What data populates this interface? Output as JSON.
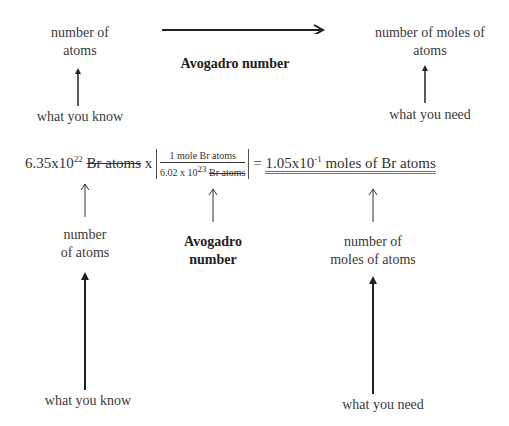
{
  "top": {
    "left_label": [
      "number of",
      "atoms"
    ],
    "center_label": "Avogadro number",
    "right_label": [
      "number of moles of",
      "atoms"
    ],
    "left_caption": "what you know",
    "right_caption": "what you need"
  },
  "equation": {
    "given_mantissa": "6.35x10",
    "given_exponent": "22",
    "given_unit": "Br atoms",
    "times": "x",
    "fraction_numerator": "1 mole Br atoms",
    "fraction_den_mantissa": "6.02 x 10",
    "fraction_den_exponent": "23",
    "fraction_den_unit": "Br atoms",
    "equals": "=",
    "result_mantissa": "1.05x10",
    "result_exponent": "-1",
    "result_unit": "moles of Br atoms"
  },
  "bottom": {
    "left_label": [
      "number",
      "of atoms"
    ],
    "center_label": [
      "Avogadro",
      "number"
    ],
    "right_label": [
      "number of",
      "moles of atoms"
    ],
    "left_caption": "what you know",
    "right_caption": "what you need"
  }
}
